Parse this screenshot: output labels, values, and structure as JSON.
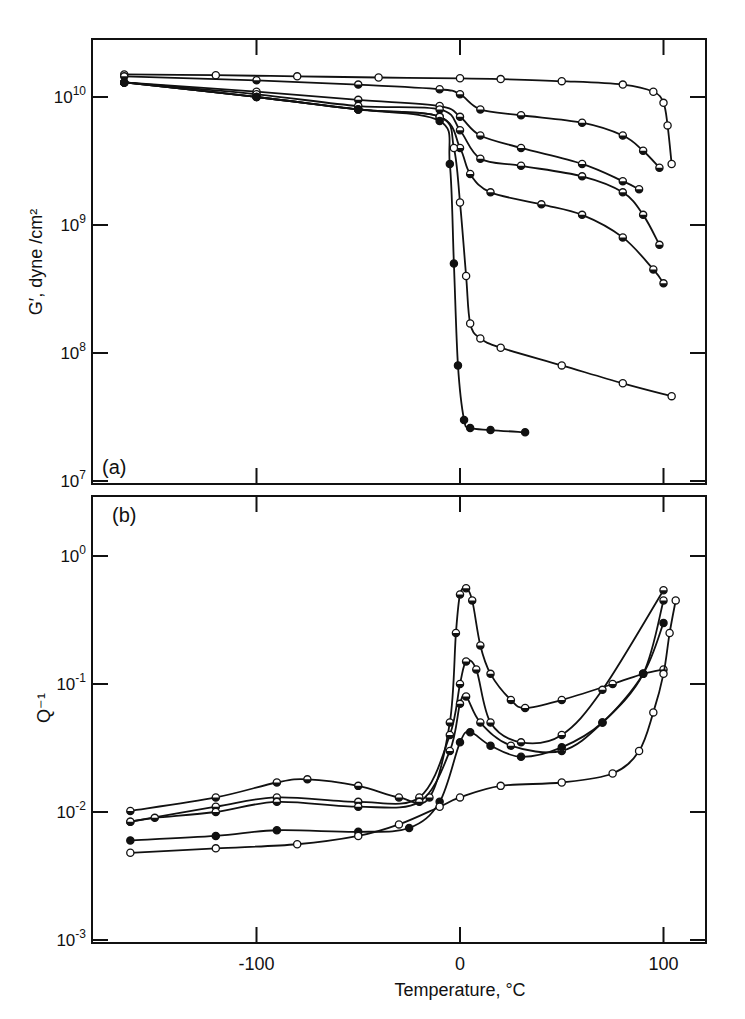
{
  "figure": {
    "panel_a_label": "(a)",
    "panel_b_label": "(b)",
    "xlabel": "Temperature, °C",
    "ylabel_a": "G′, dyne /cm²",
    "ylabel_b": "Q⁻¹"
  },
  "chart_data": [
    {
      "type": "line",
      "panel": "(a)",
      "title": "",
      "xlabel": "Temperature, °C",
      "ylabel": "G', dyne/cm^2",
      "yscale": "log",
      "xlim": [
        -181,
        121
      ],
      "ylim": [
        9500000.0,
        28000000000.0
      ],
      "xticks": [
        -100,
        0,
        100
      ],
      "yticks": [
        10000000.0,
        100000000.0,
        1000000000.0,
        10000000000.0
      ],
      "ytick_labels": [
        "10^7",
        "10^8",
        "10^9",
        "10^10"
      ],
      "grid": false,
      "legend": null,
      "series": [
        {
          "name": "curve 1 (open circles)",
          "marker": "open",
          "points": [
            [
              -165,
              15000000000.0
            ],
            [
              -120,
              14800000000.0
            ],
            [
              -80,
              14500000000.0
            ],
            [
              -40,
              14200000000.0
            ],
            [
              0,
              14000000000.0
            ],
            [
              20,
              13800000000.0
            ],
            [
              50,
              13300000000.0
            ],
            [
              80,
              12500000000.0
            ],
            [
              95,
              11000000000.0
            ],
            [
              100,
              9000000000.0
            ],
            [
              102,
              6000000000.0
            ],
            [
              104,
              3000000000.0
            ]
          ]
        },
        {
          "name": "curve 2",
          "marker": "half",
          "points": [
            [
              -165,
              14500000000.0
            ],
            [
              -100,
              13500000000.0
            ],
            [
              -50,
              12500000000.0
            ],
            [
              -10,
              11500000000.0
            ],
            [
              0,
              10500000000.0
            ],
            [
              10,
              8000000000.0
            ],
            [
              30,
              7200000000.0
            ],
            [
              60,
              6300000000.0
            ],
            [
              80,
              5000000000.0
            ],
            [
              90,
              3800000000.0
            ],
            [
              98,
              2800000000.0
            ]
          ]
        },
        {
          "name": "curve 3",
          "marker": "half",
          "points": [
            [
              -165,
              13000000000.0
            ],
            [
              -100,
              11000000000.0
            ],
            [
              -50,
              9500000000.0
            ],
            [
              -10,
              8500000000.0
            ],
            [
              0,
              7000000000.0
            ],
            [
              10,
              5000000000.0
            ],
            [
              30,
              4000000000.0
            ],
            [
              60,
              3000000000.0
            ],
            [
              80,
              2200000000.0
            ],
            [
              88,
              1900000000.0
            ]
          ]
        },
        {
          "name": "curve 4",
          "marker": "half",
          "points": [
            [
              -165,
              13000000000.0
            ],
            [
              -100,
              10500000000.0
            ],
            [
              -50,
              8500000000.0
            ],
            [
              -10,
              8000000000.0
            ],
            [
              0,
              5500000000.0
            ],
            [
              10,
              3300000000.0
            ],
            [
              30,
              2900000000.0
            ],
            [
              60,
              2400000000.0
            ],
            [
              80,
              1800000000.0
            ],
            [
              90,
              1200000000.0
            ],
            [
              98,
              700000000.0
            ]
          ]
        },
        {
          "name": "curve 5",
          "marker": "half",
          "points": [
            [
              -165,
              13000000000.0
            ],
            [
              -100,
              10000000000.0
            ],
            [
              -50,
              8000000000.0
            ],
            [
              -10,
              7000000000.0
            ],
            [
              0,
              4000000000.0
            ],
            [
              5,
              2500000000.0
            ],
            [
              15,
              1800000000.0
            ],
            [
              40,
              1450000000.0
            ],
            [
              60,
              1200000000.0
            ],
            [
              80,
              800000000.0
            ],
            [
              95,
              450000000.0
            ],
            [
              100,
              350000000.0
            ]
          ]
        },
        {
          "name": "curve 6",
          "marker": "open",
          "points": [
            [
              -165,
              13000000000.0
            ],
            [
              -100,
              10000000000.0
            ],
            [
              -50,
              8000000000.0
            ],
            [
              -10,
              7000000000.0
            ],
            [
              -3,
              4000000000.0
            ],
            [
              0,
              1500000000.0
            ],
            [
              3,
              400000000.0
            ],
            [
              5,
              170000000.0
            ],
            [
              10,
              130000000.0
            ],
            [
              20,
              110000000.0
            ],
            [
              50,
              80000000.0
            ],
            [
              80,
              58000000.0
            ],
            [
              104,
              46000000.0
            ]
          ]
        },
        {
          "name": "curve 7 (filled)",
          "marker": "filled",
          "points": [
            [
              -165,
              13000000000.0
            ],
            [
              -100,
              10000000000.0
            ],
            [
              -50,
              8000000000.0
            ],
            [
              -10,
              6500000000.0
            ],
            [
              -5,
              3000000000.0
            ],
            [
              -3,
              500000000.0
            ],
            [
              -1,
              80000000.0
            ],
            [
              2,
              30000000.0
            ],
            [
              5,
              26000000.0
            ],
            [
              15,
              25000000.0
            ],
            [
              32,
              24000000.0
            ]
          ]
        }
      ]
    },
    {
      "type": "line",
      "panel": "(b)",
      "title": "",
      "xlabel": "Temperature, °C",
      "ylabel": "Q^-1",
      "yscale": "log",
      "xlim": [
        -181,
        121
      ],
      "ylim": [
        0.00095,
        2.9
      ],
      "xticks": [
        -100,
        0,
        100
      ],
      "xtick_labels": [
        "-100",
        "0",
        "100"
      ],
      "yticks": [
        0.001,
        0.01,
        0.1,
        1
      ],
      "ytick_labels": [
        "10^-3",
        "10^-2",
        "10^-1",
        "10^0"
      ],
      "grid": false,
      "legend": null,
      "series": [
        {
          "name": "curve 1 (peak ~0.56)",
          "marker": "half",
          "points": [
            [
              -162,
              0.0102
            ],
            [
              -120,
              0.013
            ],
            [
              -90,
              0.017
            ],
            [
              -75,
              0.018
            ],
            [
              -50,
              0.016
            ],
            [
              -30,
              0.013
            ],
            [
              -15,
              0.013
            ],
            [
              -5,
              0.05
            ],
            [
              -2,
              0.25
            ],
            [
              0,
              0.5
            ],
            [
              3,
              0.56
            ],
            [
              6,
              0.45
            ],
            [
              10,
              0.2
            ],
            [
              15,
              0.12
            ],
            [
              25,
              0.075
            ],
            [
              32,
              0.065
            ],
            [
              50,
              0.075
            ],
            [
              75,
              0.1
            ],
            [
              90,
              0.12
            ],
            [
              100,
              0.13
            ]
          ]
        },
        {
          "name": "curve 2 (peak ~0.15)",
          "marker": "half",
          "points": [
            [
              -162,
              0.0084
            ],
            [
              -120,
              0.011
            ],
            [
              -90,
              0.013
            ],
            [
              -50,
              0.012
            ],
            [
              -20,
              0.013
            ],
            [
              -5,
              0.04
            ],
            [
              0,
              0.1
            ],
            [
              3,
              0.15
            ],
            [
              8,
              0.13
            ],
            [
              15,
              0.05
            ],
            [
              30,
              0.035
            ],
            [
              50,
              0.04
            ],
            [
              70,
              0.09
            ],
            [
              100,
              0.54
            ]
          ]
        },
        {
          "name": "curve 3 (peak ~0.08)",
          "marker": "half",
          "points": [
            [
              -162,
              0.0084
            ],
            [
              -150,
              0.009
            ],
            [
              -120,
              0.01
            ],
            [
              -90,
              0.012
            ],
            [
              -50,
              0.011
            ],
            [
              -20,
              0.012
            ],
            [
              -5,
              0.03
            ],
            [
              0,
              0.07
            ],
            [
              3,
              0.08
            ],
            [
              10,
              0.05
            ],
            [
              25,
              0.033
            ],
            [
              50,
              0.03
            ],
            [
              70,
              0.05
            ],
            [
              90,
              0.12
            ],
            [
              100,
              0.45
            ]
          ]
        },
        {
          "name": "curve 4 (peak ~0.042)",
          "marker": "filled",
          "points": [
            [
              -162,
              0.006
            ],
            [
              -120,
              0.0065
            ],
            [
              -90,
              0.0072
            ],
            [
              -50,
              0.007
            ],
            [
              -25,
              0.0075
            ],
            [
              -10,
              0.012
            ],
            [
              0,
              0.035
            ],
            [
              5,
              0.042
            ],
            [
              15,
              0.033
            ],
            [
              30,
              0.027
            ],
            [
              50,
              0.032
            ],
            [
              70,
              0.05
            ],
            [
              90,
              0.12
            ],
            [
              100,
              0.3
            ]
          ]
        },
        {
          "name": "curve 5 (open circles)",
          "marker": "open",
          "points": [
            [
              -162,
              0.0048
            ],
            [
              -120,
              0.0052
            ],
            [
              -80,
              0.0056
            ],
            [
              -50,
              0.0065
            ],
            [
              -30,
              0.008
            ],
            [
              -10,
              0.011
            ],
            [
              0,
              0.013
            ],
            [
              20,
              0.016
            ],
            [
              50,
              0.017
            ],
            [
              75,
              0.02
            ],
            [
              88,
              0.03
            ],
            [
              95,
              0.06
            ],
            [
              100,
              0.12
            ],
            [
              103,
              0.25
            ],
            [
              106,
              0.45
            ]
          ]
        }
      ]
    }
  ]
}
